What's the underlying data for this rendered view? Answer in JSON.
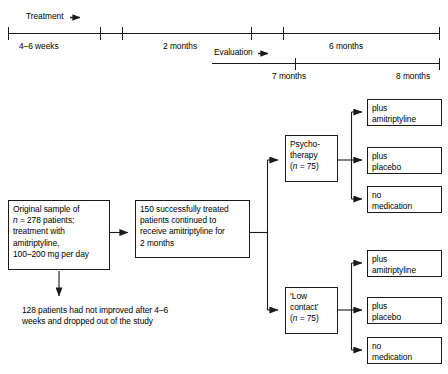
{
  "figure": {
    "type": "flowchart-with-timeline",
    "ink_color": "#1a1a1a",
    "background": "#ffffff"
  },
  "timeline": {
    "row1": {
      "phase_label": "Treatment",
      "phase_label_arrow": "right-arrow-icon",
      "segments": [
        {
          "label": "4–6 weeks"
        },
        {
          "label": "2 months"
        },
        {
          "label": "6 months"
        }
      ]
    },
    "row2": {
      "phase_label": "Evaluation",
      "phase_label_arrow": "right-arrow-icon",
      "ticks": [
        {
          "label": "7 months"
        },
        {
          "label": "8 months"
        }
      ]
    }
  },
  "flow": {
    "origin_box": "Original sample of\nn = 278 patients;\ntreatment with\namitriptyline,\n100–200 mg per day",
    "origin_box_lines": [
      "Original sample of",
      "n = 278 patients;",
      "treatment with",
      "amitriptyline,",
      "100–200 mg per day"
    ],
    "continued_box": "150 successfully treated\npatients continued to\nreceive amitriptyline for\n2 months",
    "dropout_note": "128 patients had not improved after 4–6\nweeks and dropped out of the study",
    "arm_top": "Psycho-\ntherapy\n(n = 75)",
    "arm_bottom": "‘Low\ncontact’\n(n = 75)",
    "conditions_top": [
      "plus\namitriptyline",
      "plus\nplacebo",
      "no\nmedication"
    ],
    "conditions_bottom": [
      "plus\namitriptyline",
      "plus\nplacebo",
      "no\nmedication"
    ]
  }
}
